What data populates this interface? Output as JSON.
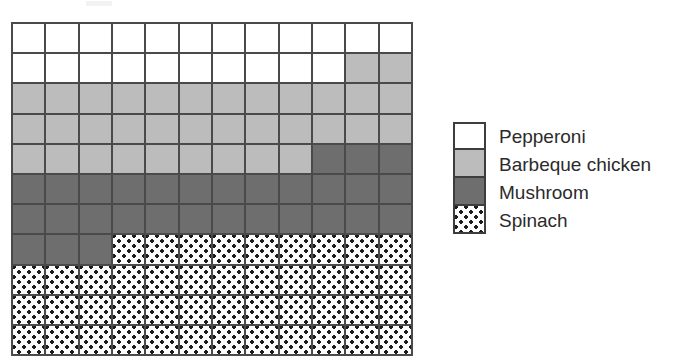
{
  "chart_data": {
    "type": "heatmap",
    "title": "",
    "subtitle": "",
    "xlabel": "",
    "ylabel": "",
    "grid": {
      "columns": 12,
      "rows_visible": 11,
      "cell_order": "row-major, left-to-right, top-to-bottom",
      "rows": [
        [
          "pepperoni",
          "pepperoni",
          "pepperoni",
          "pepperoni",
          "pepperoni",
          "pepperoni",
          "pepperoni",
          "pepperoni",
          "pepperoni",
          "pepperoni",
          "pepperoni",
          "pepperoni"
        ],
        [
          "pepperoni",
          "pepperoni",
          "pepperoni",
          "pepperoni",
          "pepperoni",
          "pepperoni",
          "pepperoni",
          "pepperoni",
          "pepperoni",
          "pepperoni",
          "barbeque",
          "barbeque"
        ],
        [
          "barbeque",
          "barbeque",
          "barbeque",
          "barbeque",
          "barbeque",
          "barbeque",
          "barbeque",
          "barbeque",
          "barbeque",
          "barbeque",
          "barbeque",
          "barbeque"
        ],
        [
          "barbeque",
          "barbeque",
          "barbeque",
          "barbeque",
          "barbeque",
          "barbeque",
          "barbeque",
          "barbeque",
          "barbeque",
          "barbeque",
          "barbeque",
          "barbeque"
        ],
        [
          "barbeque",
          "barbeque",
          "barbeque",
          "barbeque",
          "barbeque",
          "barbeque",
          "barbeque",
          "barbeque",
          "barbeque",
          "mushroom",
          "mushroom",
          "mushroom"
        ],
        [
          "mushroom",
          "mushroom",
          "mushroom",
          "mushroom",
          "mushroom",
          "mushroom",
          "mushroom",
          "mushroom",
          "mushroom",
          "mushroom",
          "mushroom",
          "mushroom"
        ],
        [
          "mushroom",
          "mushroom",
          "mushroom",
          "mushroom",
          "mushroom",
          "mushroom",
          "mushroom",
          "mushroom",
          "mushroom",
          "mushroom",
          "mushroom",
          "mushroom"
        ],
        [
          "mushroom",
          "mushroom",
          "mushroom",
          "spinach",
          "spinach",
          "spinach",
          "spinach",
          "spinach",
          "spinach",
          "spinach",
          "spinach",
          "spinach"
        ],
        [
          "spinach",
          "spinach",
          "spinach",
          "spinach",
          "spinach",
          "spinach",
          "spinach",
          "spinach",
          "spinach",
          "spinach",
          "spinach",
          "spinach"
        ],
        [
          "spinach",
          "spinach",
          "spinach",
          "spinach",
          "spinach",
          "spinach",
          "spinach",
          "spinach",
          "spinach",
          "spinach",
          "spinach",
          "spinach"
        ],
        [
          "spinach",
          "spinach",
          "spinach",
          "spinach",
          "spinach",
          "spinach",
          "spinach",
          "spinach",
          "spinach",
          "spinach",
          "spinach",
          "spinach"
        ]
      ]
    },
    "categories": [
      "Pepperoni",
      "Barbeque chicken",
      "Mushroom",
      "Spinach"
    ],
    "values": [
      22,
      35,
      27,
      45
    ],
    "colors": [
      "#ffffff",
      "#bcbcbc",
      "#6e6e6e",
      "#fcfcfc"
    ],
    "legend_position": "right"
  },
  "legend": {
    "items": [
      {
        "label": "Pepperoni",
        "key": "pepperoni",
        "swatch_class": "fill-pepperoni"
      },
      {
        "label": "Barbeque chicken",
        "key": "barbeque",
        "swatch_class": "fill-barbeque"
      },
      {
        "label": "Mushroom",
        "key": "mushroom",
        "swatch_class": "fill-mushroom"
      },
      {
        "label": "Spinach",
        "key": "spinach",
        "swatch_class": "fill-spinach"
      }
    ]
  },
  "palette": {
    "pepperoni": "#ffffff",
    "barbeque": "#bcbcbc",
    "mushroom": "#6e6e6e",
    "spinach_base": "#fcfcfc",
    "spinach_dot": "#1c1c1c",
    "grid_line": "#4a4a4a",
    "legend_border": "#3d3d3d",
    "text": "#2b2b2b"
  }
}
